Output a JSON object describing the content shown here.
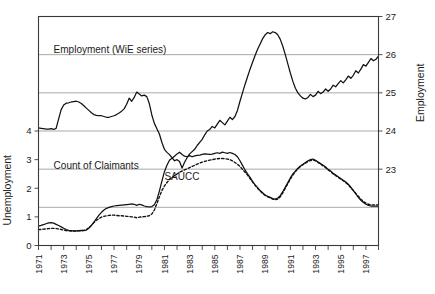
{
  "chart_data": {
    "type": "line",
    "title": "",
    "subtitle": "",
    "xlabel": "",
    "ylabel": "Unemployment",
    "ylabel_secondary": "Employment",
    "grid": true,
    "legend_position": "inline-annotations",
    "x": [
      1971,
      1972,
      1973,
      1974,
      1975,
      1976,
      1977,
      1978,
      1979,
      1980,
      1981,
      1982,
      1983,
      1984,
      1985,
      1986,
      1987,
      1988,
      1989,
      1990,
      1991,
      1992,
      1993,
      1994,
      1995,
      1996,
      1997,
      1998
    ],
    "xlim": [
      1971,
      1998
    ],
    "xticks": [
      1971,
      1972,
      1973,
      1974,
      1975,
      1976,
      1977,
      1978,
      1979,
      1980,
      1981,
      1982,
      1983,
      1984,
      1985,
      1986,
      1987,
      1988,
      1989,
      1990,
      1991,
      1992,
      1993,
      1994,
      1995,
      1996,
      1997,
      1998
    ],
    "xtick_labels": [
      "1971",
      "",
      "1973",
      "",
      "1975",
      "",
      "1977",
      "",
      "1979",
      "",
      "1981",
      "",
      "1983",
      "",
      "1985",
      "",
      "1987",
      "",
      "1989",
      "",
      "1991",
      "",
      "1993",
      "",
      "1995",
      "",
      "1997",
      ""
    ],
    "ylim_left": [
      0,
      8
    ],
    "yticks_left": [
      0,
      1,
      2,
      3,
      4
    ],
    "ytick_labels_left": [
      "0",
      "1",
      "2",
      "3",
      "4"
    ],
    "ylim_right": [
      21,
      27
    ],
    "yticks_right": [
      23,
      24,
      25,
      26,
      27
    ],
    "ytick_labels_right": [
      "23",
      "24",
      "25",
      "26",
      "27"
    ],
    "annotations": [
      {
        "text": "Employment (WiE series)",
        "x": 1972.2,
        "y_axis": "right",
        "y": 26.05
      },
      {
        "text": "Count of Claimants",
        "x": 1972.2,
        "y_axis": "left",
        "y": 2.68
      },
      {
        "text": "SAUCC",
        "x": 1981.0,
        "y_axis": "left",
        "y": 2.3
      }
    ],
    "series": [
      {
        "name": "Employment (WiE series)",
        "axis": "right",
        "style": "solid",
        "color": "#111111",
        "unit": "millions",
        "values_quarterly": [
          24.08,
          24.07,
          24.06,
          24.05,
          24.05,
          24.06,
          24.04,
          24.07,
          24.32,
          24.56,
          24.68,
          24.73,
          24.74,
          24.76,
          24.77,
          24.78,
          24.76,
          24.72,
          24.66,
          24.6,
          24.54,
          24.48,
          24.43,
          24.41,
          24.4,
          24.4,
          24.38,
          24.36,
          24.36,
          24.38,
          24.4,
          24.43,
          24.47,
          24.52,
          24.58,
          24.7,
          24.86,
          24.78,
          24.88,
          25.02,
          24.97,
          24.92,
          24.94,
          24.9,
          24.72,
          24.42,
          24.2,
          24.06,
          23.92,
          23.7,
          23.52,
          23.44,
          23.38,
          23.3,
          23.22,
          23.25,
          23.2,
          23.03,
          23.18,
          23.3,
          23.4,
          23.46,
          23.52,
          23.62,
          23.7,
          23.78,
          23.9,
          24.0,
          24.04,
          24.12,
          24.08,
          24.18,
          24.28,
          24.22,
          24.16,
          24.26,
          24.36,
          24.3,
          24.38,
          24.54,
          24.78,
          25.0,
          25.22,
          25.42,
          25.62,
          25.8,
          25.98,
          26.14,
          26.28,
          26.42,
          26.52,
          26.58,
          26.55,
          26.6,
          26.58,
          26.52,
          26.4,
          26.22,
          26.0,
          25.76,
          25.52,
          25.3,
          25.12,
          25.0,
          24.92,
          24.86,
          24.84,
          24.88,
          24.96,
          24.9,
          24.94,
          25.04,
          24.98,
          25.02,
          25.1,
          25.04,
          25.1,
          25.2,
          25.16,
          25.24,
          25.32,
          25.26,
          25.34,
          25.44,
          25.38,
          25.46,
          25.58,
          25.52,
          25.62,
          25.74,
          25.7,
          25.8,
          25.9,
          25.84,
          25.88,
          25.96
        ]
      },
      {
        "name": "Count of Claimants",
        "axis": "left",
        "style": "solid",
        "color": "#111111",
        "unit": "millions",
        "values_quarterly": [
          0.68,
          0.7,
          0.73,
          0.76,
          0.79,
          0.8,
          0.78,
          0.74,
          0.7,
          0.65,
          0.6,
          0.56,
          0.53,
          0.52,
          0.51,
          0.51,
          0.52,
          0.53,
          0.52,
          0.54,
          0.6,
          0.7,
          0.82,
          0.94,
          1.06,
          1.16,
          1.24,
          1.3,
          1.33,
          1.36,
          1.38,
          1.39,
          1.4,
          1.41,
          1.42,
          1.43,
          1.44,
          1.45,
          1.44,
          1.4,
          1.44,
          1.42,
          1.38,
          1.36,
          1.35,
          1.36,
          1.42,
          1.6,
          1.9,
          2.25,
          2.58,
          2.8,
          2.98,
          3.05,
          3.12,
          3.2,
          3.26,
          3.18,
          3.12,
          3.1,
          3.14,
          3.1,
          3.13,
          3.15,
          3.16,
          3.18,
          3.2,
          3.19,
          3.18,
          3.19,
          3.22,
          3.24,
          3.22,
          3.26,
          3.24,
          3.22,
          3.25,
          3.22,
          3.18,
          3.1,
          2.96,
          2.8,
          2.64,
          2.5,
          2.38,
          2.24,
          2.12,
          2.02,
          1.92,
          1.84,
          1.76,
          1.72,
          1.68,
          1.64,
          1.62,
          1.66,
          1.74,
          1.88,
          2.04,
          2.2,
          2.36,
          2.5,
          2.6,
          2.7,
          2.78,
          2.84,
          2.9,
          2.96,
          3.0,
          3.02,
          2.98,
          2.92,
          2.86,
          2.8,
          2.74,
          2.66,
          2.6,
          2.52,
          2.46,
          2.4,
          2.34,
          2.28,
          2.22,
          2.14,
          2.04,
          1.92,
          1.8,
          1.68,
          1.58,
          1.5,
          1.44,
          1.4,
          1.38,
          1.38,
          1.38,
          1.38
        ]
      },
      {
        "name": "SAUCC",
        "axis": "left",
        "style": "dashed",
        "color": "#111111",
        "unit": "millions",
        "values_quarterly": [
          0.56,
          0.56,
          0.57,
          0.58,
          0.59,
          0.6,
          0.6,
          0.59,
          0.58,
          0.56,
          0.54,
          0.52,
          0.51,
          0.5,
          0.5,
          0.5,
          0.51,
          0.52,
          0.53,
          0.56,
          0.62,
          0.7,
          0.8,
          0.88,
          0.94,
          0.99,
          1.02,
          1.04,
          1.05,
          1.06,
          1.06,
          1.05,
          1.04,
          1.04,
          1.03,
          1.02,
          1.01,
          1.0,
          0.99,
          0.97,
          0.99,
          1.0,
          1.01,
          1.02,
          1.04,
          1.1,
          1.24,
          1.46,
          1.7,
          1.92,
          2.08,
          2.2,
          2.3,
          2.38,
          2.44,
          2.5,
          2.56,
          2.6,
          2.64,
          2.68,
          2.72,
          2.76,
          2.8,
          2.84,
          2.88,
          2.91,
          2.94,
          2.96,
          2.98,
          3.0,
          3.02,
          3.03,
          3.04,
          3.04,
          3.03,
          3.02,
          3.0,
          2.96,
          2.9,
          2.84,
          2.76,
          2.66,
          2.56,
          2.46,
          2.34,
          2.22,
          2.1,
          2.0,
          1.9,
          1.82,
          1.75,
          1.7,
          1.66,
          1.62,
          1.6,
          1.62,
          1.7,
          1.84,
          2.0,
          2.16,
          2.32,
          2.46,
          2.58,
          2.68,
          2.76,
          2.82,
          2.88,
          2.93,
          2.97,
          2.99,
          2.96,
          2.9,
          2.84,
          2.78,
          2.72,
          2.64,
          2.58,
          2.5,
          2.44,
          2.38,
          2.32,
          2.26,
          2.2,
          2.12,
          2.02,
          1.92,
          1.82,
          1.72,
          1.62,
          1.54,
          1.48,
          1.44,
          1.42,
          1.42,
          1.42,
          1.42
        ]
      }
    ]
  }
}
